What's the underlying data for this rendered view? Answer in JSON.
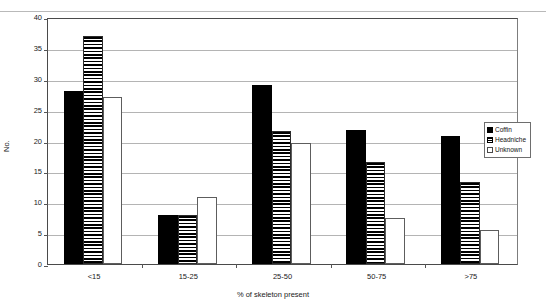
{
  "chart_data": {
    "type": "bar",
    "title": "",
    "xlabel": "% of skeleton present",
    "ylabel": "No.",
    "categories": [
      "<15",
      "15-25",
      "25-50",
      "50-75",
      ">75"
    ],
    "series": [
      {
        "name": "Coffin",
        "values": [
          28,
          8,
          29,
          21.7,
          20.7
        ]
      },
      {
        "name": "Headniche",
        "values": [
          37,
          8,
          21.6,
          16.5,
          13.3
        ]
      },
      {
        "name": "Unknown",
        "values": [
          27,
          10.8,
          19.6,
          7.5,
          5.5
        ]
      }
    ],
    "ylim": [
      0,
      40
    ],
    "yticks": [
      0,
      5,
      10,
      15,
      20,
      25,
      30,
      35,
      40
    ],
    "ytick_labels": [
      "0",
      "5",
      "10",
      "15",
      "20",
      "25",
      "30",
      "35",
      "40"
    ],
    "grid": true,
    "legend_position": "right",
    "legend_entries": [
      {
        "label": "Coffin",
        "pattern": "solid-black"
      },
      {
        "label": "Headniche",
        "pattern": "horizontal-stripes"
      },
      {
        "label": "Unknown",
        "pattern": "white-outline"
      }
    ]
  }
}
